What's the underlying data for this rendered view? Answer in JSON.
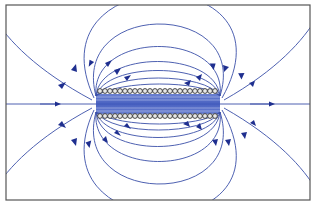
{
  "figure": {
    "title": "Magnetic field lines of a solenoid",
    "colors": {
      "frame": "#555555",
      "field_line": "#3a4fa8",
      "arrow": "#1f2f8f",
      "interior_field": "#4a64c4",
      "coil_wire": "#333333",
      "background": "#ffffff"
    },
    "coil": {
      "turns_per_row": 24,
      "rows": [
        "top",
        "bottom"
      ],
      "current_symbol": "circle"
    },
    "frame": {
      "x": 6,
      "y": 5,
      "width": 304,
      "height": 195
    }
  }
}
